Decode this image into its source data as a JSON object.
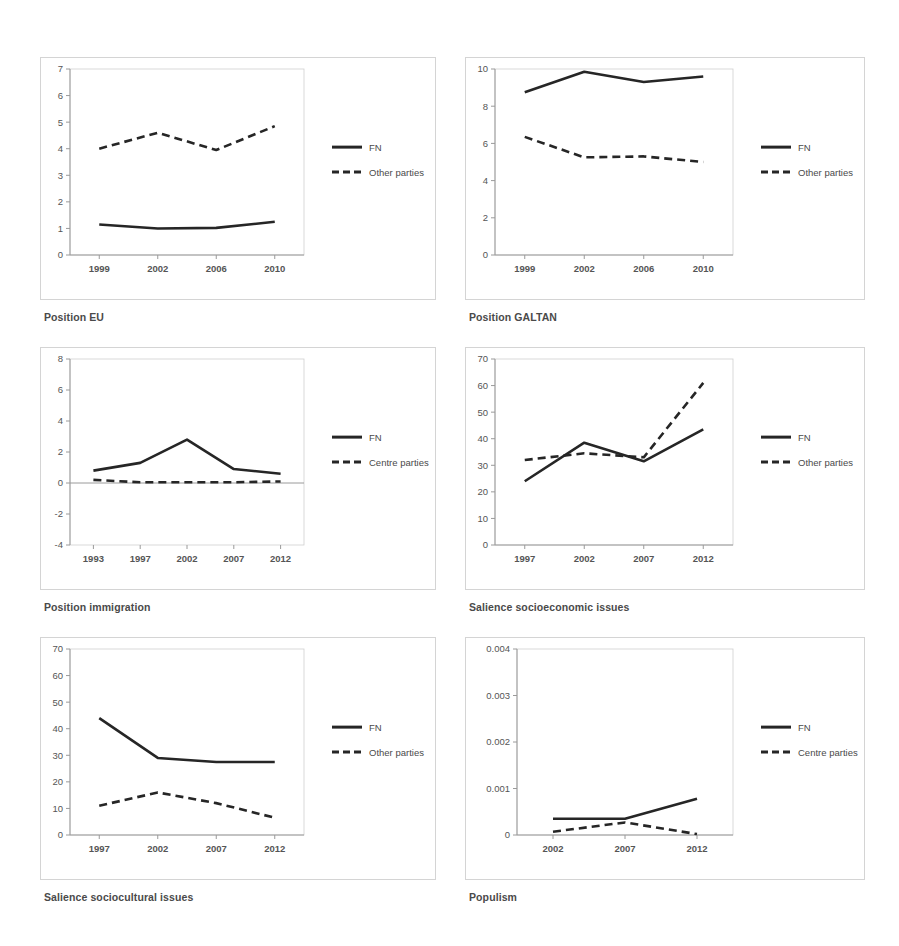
{
  "figure": {
    "background_color": "#ffffff",
    "line_color": "#262626",
    "frame_color": "#d4d4d4",
    "axis_color": "#9a9a9a"
  },
  "panels": [
    {
      "id": "position-eu",
      "caption": "Position EU",
      "legend": [
        "FN",
        "Other parties"
      ]
    },
    {
      "id": "position-galtan",
      "caption": "Position GALTAN",
      "legend": [
        "FN",
        "Other parties"
      ]
    },
    {
      "id": "position-immigration",
      "caption": "Position immigration",
      "legend": [
        "FN",
        "Centre parties"
      ]
    },
    {
      "id": "salience-socioeconomic",
      "caption": "Salience socioeconomic issues",
      "legend": [
        "FN",
        "Other parties"
      ]
    },
    {
      "id": "salience-sociocultural",
      "caption": "Salience sociocultural issues",
      "legend": [
        "FN",
        "Other parties"
      ]
    },
    {
      "id": "populism",
      "caption": "Populism",
      "legend": [
        "FN",
        "Centre parties"
      ]
    }
  ],
  "chart_data": [
    {
      "type": "line",
      "title": "Position EU",
      "xlabel": "",
      "ylabel": "",
      "categories": [
        "1999",
        "2002",
        "2006",
        "2010"
      ],
      "yticks": [
        0,
        1,
        2,
        3,
        4,
        5,
        6,
        7
      ],
      "ylim": [
        0,
        7
      ],
      "grid": false,
      "legend_position": "right",
      "series": [
        {
          "name": "FN",
          "style": "solid",
          "values": [
            1.15,
            1.0,
            1.02,
            1.25
          ]
        },
        {
          "name": "Other parties",
          "style": "dashed",
          "values": [
            4.0,
            4.6,
            3.95,
            4.85
          ]
        }
      ]
    },
    {
      "type": "line",
      "title": "Position GALTAN",
      "xlabel": "",
      "ylabel": "",
      "categories": [
        "1999",
        "2002",
        "2006",
        "2010"
      ],
      "yticks": [
        0,
        2,
        4,
        6,
        8,
        10
      ],
      "ylim": [
        0,
        10
      ],
      "grid": false,
      "legend_position": "right",
      "series": [
        {
          "name": "FN",
          "style": "solid",
          "values": [
            8.75,
            9.85,
            9.3,
            9.6
          ]
        },
        {
          "name": "Other parties",
          "style": "dashed",
          "values": [
            6.35,
            5.25,
            5.3,
            5.0
          ]
        }
      ]
    },
    {
      "type": "line",
      "title": "Position immigration",
      "xlabel": "",
      "ylabel": "",
      "categories": [
        "1993",
        "1997",
        "2002",
        "2007",
        "2012"
      ],
      "yticks": [
        -4,
        -2,
        0,
        2,
        4,
        6,
        8
      ],
      "ylim": [
        -4,
        8
      ],
      "grid": false,
      "legend_position": "right",
      "series": [
        {
          "name": "FN",
          "style": "solid",
          "values": [
            0.8,
            1.3,
            2.8,
            0.9,
            0.6
          ]
        },
        {
          "name": "Centre parties",
          "style": "dashed",
          "values": [
            0.2,
            0.05,
            0.05,
            0.05,
            0.1
          ]
        }
      ]
    },
    {
      "type": "line",
      "title": "Salience socioeconomic issues",
      "xlabel": "",
      "ylabel": "",
      "categories": [
        "1997",
        "2002",
        "2007",
        "2012"
      ],
      "yticks": [
        0,
        10,
        20,
        30,
        40,
        50,
        60,
        70
      ],
      "ylim": [
        0,
        70
      ],
      "grid": false,
      "legend_position": "right",
      "series": [
        {
          "name": "FN",
          "style": "solid",
          "values": [
            24,
            38.5,
            31.5,
            43.5
          ]
        },
        {
          "name": "Other parties",
          "style": "dashed",
          "values": [
            32,
            34.5,
            33,
            61
          ]
        }
      ]
    },
    {
      "type": "line",
      "title": "Salience sociocultural issues",
      "xlabel": "",
      "ylabel": "",
      "categories": [
        "1997",
        "2002",
        "2007",
        "2012"
      ],
      "yticks": [
        0,
        10,
        20,
        30,
        40,
        50,
        60,
        70
      ],
      "ylim": [
        0,
        70
      ],
      "grid": false,
      "legend_position": "right",
      "series": [
        {
          "name": "FN",
          "style": "solid",
          "values": [
            44,
            29,
            27.5,
            27.5
          ]
        },
        {
          "name": "Other parties",
          "style": "dashed",
          "values": [
            11,
            16,
            12,
            6.5
          ]
        }
      ]
    },
    {
      "type": "line",
      "title": "Populism",
      "xlabel": "",
      "ylabel": "",
      "categories": [
        "2002",
        "2007",
        "2012"
      ],
      "yticks": [
        0,
        0.001,
        0.002,
        0.003,
        0.004
      ],
      "ytick_labels": [
        "0",
        "0.001",
        "0.002",
        "0.003",
        "0.004"
      ],
      "ylim": [
        0,
        0.004
      ],
      "grid": false,
      "legend_position": "right",
      "series": [
        {
          "name": "FN",
          "style": "solid",
          "values": [
            0.00035,
            0.00035,
            0.00078
          ]
        },
        {
          "name": "Centre parties",
          "style": "dashed",
          "values": [
            7e-05,
            0.00027,
            2e-05
          ]
        }
      ]
    }
  ]
}
